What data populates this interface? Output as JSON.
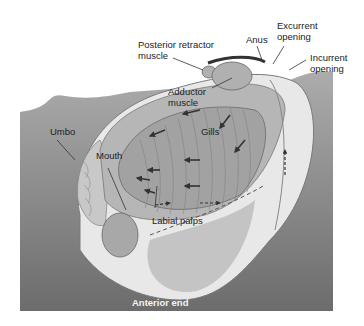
{
  "diagram": {
    "colors": {
      "background": "#ffffff",
      "substrate_top": "#a9a9a9",
      "substrate_bottom": "#6e6e6e",
      "body": "#b8b8b8",
      "gills": "#9c9c9c",
      "mantle_light": "#e6e6e6",
      "arrows": "#3a3a3a",
      "label_text": "#222222",
      "anterior_text": "#f4f4f4"
    },
    "labels": {
      "posterior_retractor": "Posterior retractor\nmuscle",
      "anus": "Anus",
      "excurrent": "Excurrent\nopening",
      "incurrent": "Incurrent\nopening",
      "adductor": "Adductor\nmuscle",
      "umbo": "Umbo",
      "gills": "Gills",
      "mouth": "Mouth",
      "labial_palps": "Labial palps",
      "anterior_end": "Anterior end"
    }
  }
}
